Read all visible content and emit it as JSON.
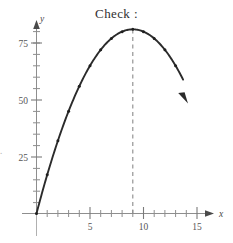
{
  "title": "Check :",
  "edge_artifact": ".",
  "colors": {
    "background": "#ffffff",
    "axis": "#8e8e8e",
    "curve": "#2b2b2b",
    "dashed_line": "#8a8a8a",
    "tick_label": "#555555",
    "title": "#2f2f2f"
  },
  "axes": {
    "x_name": "x",
    "y_name": "y",
    "x_tick_labels": [
      "5",
      "10",
      "15"
    ],
    "y_tick_labels": [
      "25",
      "50",
      "75"
    ]
  },
  "chart_data": {
    "type": "line",
    "title": "Check :",
    "xlabel": "x",
    "ylabel": "y",
    "xlim": [
      0,
      16
    ],
    "ylim": [
      0,
      90
    ],
    "grid": false,
    "legend": null,
    "x_ticks": [
      0,
      1,
      2,
      3,
      4,
      5,
      6,
      7,
      8,
      9,
      10,
      11,
      12,
      13,
      14,
      15
    ],
    "x_major_ticks": [
      5,
      10,
      15
    ],
    "x_tick_labels": [
      "5",
      "10",
      "15"
    ],
    "y_ticks": [
      5,
      10,
      15,
      20,
      25,
      30,
      35,
      40,
      45,
      50,
      55,
      60,
      65,
      70,
      75,
      80
    ],
    "y_major_ticks": [
      25,
      50,
      75
    ],
    "y_tick_labels": [
      "25",
      "50",
      "75"
    ],
    "equation": "y = 18x - x^2",
    "vertex": {
      "x": 9,
      "y": 81
    },
    "annotations": [
      {
        "type": "dashed-vline",
        "x": 9,
        "y_from": 0,
        "y_to": 81
      },
      {
        "type": "arrowhead",
        "x": 13.7,
        "y": 58.8,
        "label": "curve-end-arrow"
      }
    ],
    "markers": {
      "shown": true,
      "at": "integer x values 0 through 13"
    },
    "series": [
      {
        "name": "h",
        "x": [
          0,
          1,
          2,
          3,
          4,
          5,
          6,
          7,
          8,
          9,
          10,
          11,
          12,
          13,
          13.7
        ],
        "values": [
          0,
          17,
          32,
          45,
          56,
          65,
          72,
          77,
          80,
          81,
          80,
          77,
          72,
          65,
          58.8
        ]
      }
    ]
  }
}
